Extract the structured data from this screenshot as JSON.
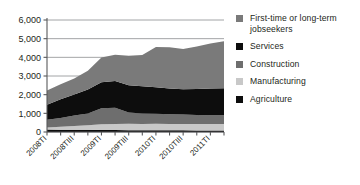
{
  "chart_data": {
    "type": "area",
    "stacked": true,
    "title": "",
    "subtitle": "",
    "xlabel": "",
    "ylabel": "",
    "ylim": [
      0,
      6000
    ],
    "ytick_values": [
      0,
      1000,
      2000,
      3000,
      4000,
      5000,
      6000
    ],
    "ytick_labels": [
      "0",
      "1,000",
      "2,000",
      "3,000",
      "4,000",
      "5,000",
      "6,000"
    ],
    "grid": true,
    "grid_axis": "y",
    "legend_position": "right",
    "categories": [
      "2008TI",
      "2008TII",
      "2008TIII",
      "2008TIV",
      "2009TI",
      "2009TII",
      "2009TIII",
      "2009TIV",
      "2010TI",
      "2010TII",
      "2010TIII",
      "2010TIV",
      "2011TI",
      "2011TII"
    ],
    "xtick_labels": [
      "2008TI",
      "2008TIII",
      "2009TI",
      "2009TIII",
      "2010TI",
      "2010TIII",
      "2011TI"
    ],
    "xtick_indices": [
      0,
      2,
      4,
      6,
      8,
      10,
      12
    ],
    "series": [
      {
        "name": "Agriculture",
        "color": "#0d0d0d",
        "values": [
          130,
          125,
          120,
          115,
          110,
          105,
          100,
          95,
          95,
          90,
          90,
          85,
          85,
          85
        ]
      },
      {
        "name": "Manufacturing",
        "color": "#c8c8c8",
        "values": [
          110,
          150,
          200,
          240,
          300,
          330,
          340,
          340,
          345,
          345,
          345,
          340,
          340,
          345
        ]
      },
      {
        "name": "Construction",
        "color": "#6e6e6e",
        "values": [
          420,
          480,
          560,
          640,
          860,
          870,
          600,
          560,
          540,
          520,
          500,
          480,
          470,
          470
        ]
      },
      {
        "name": "Services",
        "color": "#0d0d0d",
        "values": [
          800,
          1000,
          1130,
          1280,
          1400,
          1430,
          1470,
          1450,
          1420,
          1380,
          1350,
          1400,
          1430,
          1450
        ]
      },
      {
        "name": "First-time or long-term jobseekers",
        "color": "#7a7a7a",
        "values": [
          760,
          800,
          850,
          1000,
          1320,
          1400,
          1580,
          1680,
          2150,
          2210,
          2160,
          2280,
          2420,
          2510
        ]
      }
    ]
  },
  "legend": {
    "items": [
      {
        "label": "First-time or long-term jobseekers",
        "color": "#7a7a7a",
        "swatch_name": "legend-swatch-jobseekers"
      },
      {
        "label": "Services",
        "color": "#0d0d0d",
        "swatch_name": "legend-swatch-services"
      },
      {
        "label": "Construction",
        "color": "#6e6e6e",
        "swatch_name": "legend-swatch-construction"
      },
      {
        "label": "Manufacturing",
        "color": "#c8c8c8",
        "swatch_name": "legend-swatch-manufacturing"
      },
      {
        "label": "Agriculture",
        "color": "#0d0d0d",
        "swatch_name": "legend-swatch-agriculture"
      }
    ]
  },
  "axis": {
    "line_color": "#58595b",
    "grid_color": "#8c8d8f"
  }
}
